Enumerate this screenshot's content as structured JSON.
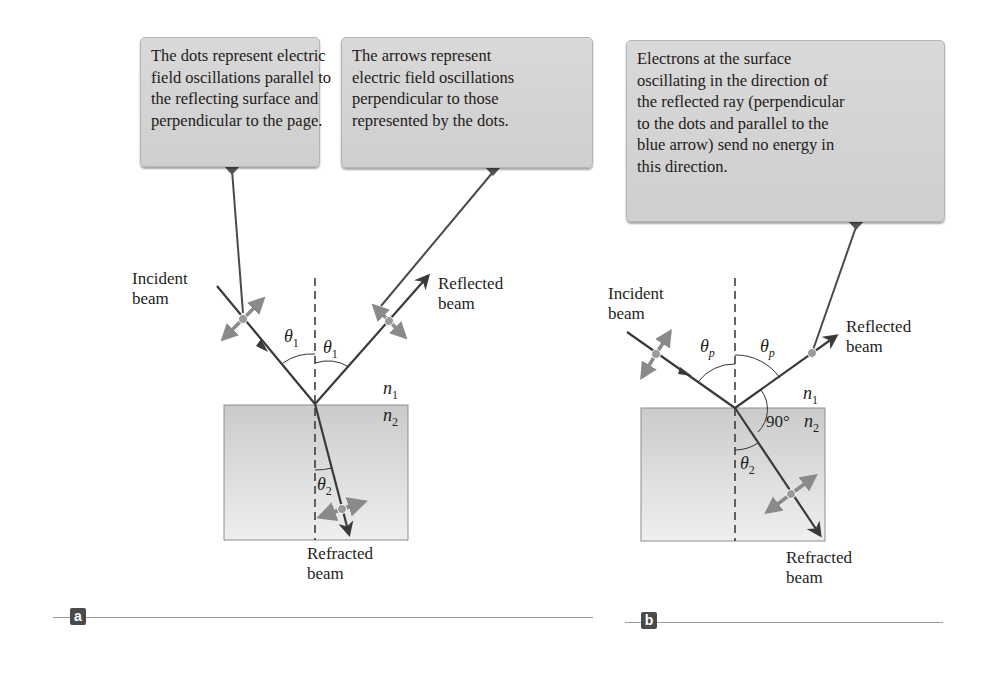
{
  "panel_a": {
    "tag": "a",
    "callout_left": {
      "lines": [
        "The dots represent electric",
        "field oscillations parallel to",
        "the reflecting surface and",
        "perpendicular to the page."
      ]
    },
    "callout_right": {
      "lines": [
        "The arrows represent",
        "electric field oscillations",
        "perpendicular to those",
        "represented by the dots."
      ]
    },
    "incident_label": [
      "Incident",
      "beam"
    ],
    "reflected_label": [
      "Reflected",
      "beam"
    ],
    "refracted_label": [
      "Refracted",
      "beam"
    ],
    "angle_incident": {
      "symbol": "θ",
      "sub": "1"
    },
    "angle_reflected": {
      "symbol": "θ",
      "sub": "1"
    },
    "angle_refracted": {
      "symbol": "θ",
      "sub": "2"
    },
    "medium_top": {
      "symbol": "n",
      "sub": "1"
    },
    "medium_bottom": {
      "symbol": "n",
      "sub": "2"
    }
  },
  "panel_b": {
    "tag": "b",
    "callout": {
      "lines": [
        "Electrons at the surface",
        "oscillating in the direction of",
        "the reflected ray (perpendicular",
        "to the dots and parallel to the",
        "blue arrow) send no energy in",
        "this direction."
      ]
    },
    "incident_label": [
      "Incident",
      "beam"
    ],
    "reflected_label": [
      "Reflected",
      "beam"
    ],
    "refracted_label": [
      "Refracted",
      "beam"
    ],
    "angle_incident": {
      "symbol": "θ",
      "sub": "p"
    },
    "angle_reflected": {
      "symbol": "θ",
      "sub": "p"
    },
    "angle_refracted": {
      "symbol": "θ",
      "sub": "2"
    },
    "right_angle": "90°",
    "medium_top": {
      "symbol": "n",
      "sub": "1"
    },
    "medium_bottom": {
      "symbol": "n",
      "sub": "2"
    }
  },
  "colors": {
    "ray": "#3a3a3a",
    "polarization_arrow": "#8a8a8a",
    "dot": "#9a9a9a",
    "medium_fill_top": "#cdcdcd",
    "medium_fill_bottom": "#ececec",
    "callout_fill": "#d4d4d4"
  }
}
